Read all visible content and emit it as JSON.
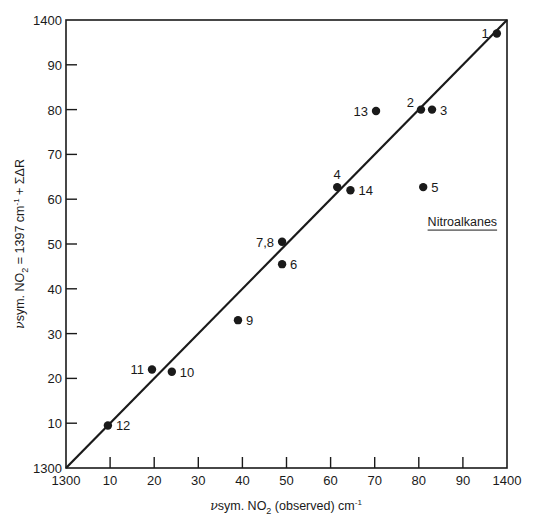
{
  "chart_data": {
    "type": "scatter",
    "title": "",
    "xlabel": "νsym. NO₂ (observed) cm⁻¹",
    "ylabel": "νsym. NO₂ = 1397 cm⁻¹ + ΣΔR",
    "xlim": [
      1300,
      1400
    ],
    "ylim": [
      1300,
      1400
    ],
    "grid": false,
    "legend": null,
    "x_ticks": [
      1300,
      1310,
      1320,
      1330,
      1340,
      1350,
      1360,
      1370,
      1380,
      1390,
      1400
    ],
    "x_tick_labels": [
      "1300",
      "10",
      "20",
      "30",
      "40",
      "50",
      "60",
      "70",
      "80",
      "90",
      "1400"
    ],
    "y_ticks": [
      1300,
      1310,
      1320,
      1330,
      1340,
      1350,
      1360,
      1370,
      1380,
      1390,
      1400
    ],
    "y_tick_labels": [
      "1300",
      "10",
      "20",
      "30",
      "40",
      "50",
      "60",
      "70",
      "80",
      "90",
      "1400"
    ],
    "reference_line": {
      "label": "y = x",
      "from": [
        1300,
        1300
      ],
      "to": [
        1400,
        1400
      ]
    },
    "annotations": [
      {
        "text": "Nitroalkanes",
        "x": 1382,
        "y": 1354,
        "underline": true
      }
    ],
    "points": [
      {
        "label": "1",
        "x": 1397.7,
        "y": 1397.0,
        "label_pos": "left"
      },
      {
        "label": "2",
        "x": 1380.5,
        "y": 1380.0,
        "label_pos": "upper-left"
      },
      {
        "label": "3",
        "x": 1383.0,
        "y": 1380.0,
        "label_pos": "right"
      },
      {
        "label": "4",
        "x": 1361.5,
        "y": 1362.7,
        "label_pos": "above"
      },
      {
        "label": "5",
        "x": 1381.0,
        "y": 1362.7,
        "label_pos": "right"
      },
      {
        "label": "6",
        "x": 1349.0,
        "y": 1345.5,
        "label_pos": "right"
      },
      {
        "label": "7,8",
        "x": 1349.0,
        "y": 1350.5,
        "label_pos": "left"
      },
      {
        "label": "9",
        "x": 1339.0,
        "y": 1333.0,
        "label_pos": "right"
      },
      {
        "label": "10",
        "x": 1324.0,
        "y": 1321.5,
        "label_pos": "right"
      },
      {
        "label": "11",
        "x": 1319.5,
        "y": 1322.0,
        "label_pos": "left"
      },
      {
        "label": "12",
        "x": 1309.5,
        "y": 1309.5,
        "label_pos": "right"
      },
      {
        "label": "13",
        "x": 1370.3,
        "y": 1379.7,
        "label_pos": "left"
      },
      {
        "label": "14",
        "x": 1364.5,
        "y": 1362.0,
        "label_pos": "right"
      }
    ]
  },
  "axes": {
    "xlabel_parts": {
      "nu": "ν",
      "sym": "sym. NO",
      "sub": "2",
      "rest": " (observed) cm",
      "sup": "-1"
    },
    "ylabel_parts": {
      "nu": "ν",
      "sym": "sym. NO",
      "sub": "2",
      "mid": " = 1397 cm",
      "sup": "-1",
      "rest": " + ΣΔR"
    }
  },
  "colors": {
    "ink": "#1a1a1a",
    "background": "#ffffff"
  }
}
